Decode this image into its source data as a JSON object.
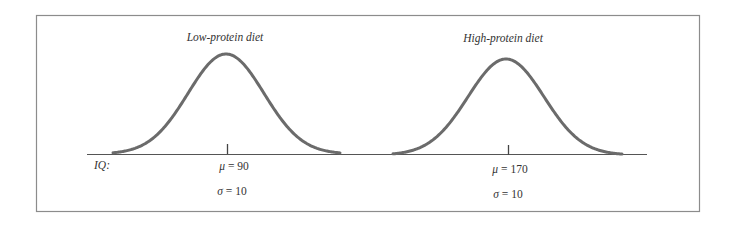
{
  "figure": {
    "axis_label": "IQ:",
    "frame_color": "#8c8c8c",
    "curve_color": "#6b6b6b",
    "axis_color": "#555555",
    "panels": [
      {
        "title": "Low-protein diet",
        "mean_symbol": "μ",
        "mean_eq": "= 90",
        "sd_symbol": "σ",
        "sd_eq": "= 10"
      },
      {
        "title": "High-protein diet",
        "mean_symbol": "μ",
        "mean_eq": "= 170",
        "sd_symbol": "σ",
        "sd_eq": "= 10"
      }
    ]
  },
  "chart_data": {
    "type": "line",
    "title": "",
    "xlabel": "IQ",
    "ylabel": "",
    "grid": false,
    "legend": "none",
    "series": [
      {
        "name": "Low-protein diet",
        "distribution": "normal",
        "mean": 90,
        "sd": 10,
        "annotations": [
          "μ = 90",
          "σ = 10"
        ]
      },
      {
        "name": "High-protein diet",
        "distribution": "normal",
        "mean": 170,
        "sd": 10,
        "annotations": [
          "μ = 170",
          "σ = 10"
        ]
      }
    ]
  }
}
